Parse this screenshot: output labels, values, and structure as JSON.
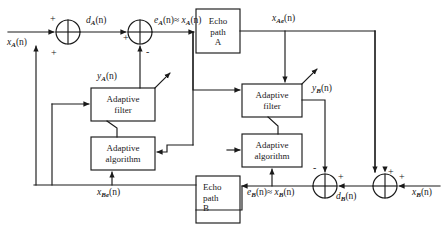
{
  "figure": {
    "type": "block-diagram",
    "domain": "signal-processing"
  },
  "blocks": [
    {
      "id": "echo-path-a",
      "lines": [
        "Echo",
        "path",
        "A"
      ],
      "align": "center"
    },
    {
      "id": "adaptive-filter-a",
      "lines": [
        "Adaptive",
        "filter"
      ],
      "align": "center"
    },
    {
      "id": "adaptive-algorithm-a",
      "lines": [
        "Adaptive",
        "algorithm"
      ],
      "align": "center"
    },
    {
      "id": "echo-path-b",
      "lines": [
        "Echo",
        "path",
        "B"
      ],
      "align": "left"
    },
    {
      "id": "adaptive-filter-b",
      "lines": [
        "Adaptive",
        "filter"
      ],
      "align": "center"
    },
    {
      "id": "adaptive-algorithm-b",
      "lines": [
        "Adaptive",
        "algorithm"
      ],
      "align": "center"
    }
  ],
  "signals": {
    "x_a": {
      "base": "x",
      "sub": "A",
      "arg": "(n)",
      "text": "x_A(n)"
    },
    "d_a": {
      "base": "d",
      "sub": "A",
      "arg": "(n)",
      "text": "d_A(n)"
    },
    "e_a": {
      "base": "e",
      "sub": "A",
      "arg": "(n)",
      "text": "e_A(n)"
    },
    "e_a_approx": {
      "text": "e_A(n) ≈ x_A(n)"
    },
    "y_a": {
      "base": "y",
      "sub": "A",
      "arg": "(n)",
      "text": "y_A(n)"
    },
    "x_ae": {
      "base": "x",
      "sub": "Ae",
      "arg": "(n)",
      "text": "x_Ae(n)"
    },
    "x_be": {
      "base": "x",
      "sub": "Be",
      "arg": "(n)",
      "text": "x_Be(n)"
    },
    "x_b": {
      "base": "x",
      "sub": "B",
      "arg": "(n)",
      "text": "x_B(n)"
    },
    "d_b": {
      "base": "d",
      "sub": "B",
      "arg": "(n)",
      "text": "d_B(n)"
    },
    "e_b_approx": {
      "text": "e_B(n) ≈ x_B(n)"
    },
    "y_b": {
      "base": "y",
      "sub": "B",
      "arg": "(n)",
      "text": "y_B(n)"
    }
  },
  "summers": [
    {
      "id": "summer-a1",
      "signs": {
        "left_input": "+",
        "bottom_input": "+"
      },
      "output_label": "d_A(n)"
    },
    {
      "id": "summer-a2",
      "signs": {
        "left_input": "+",
        "bottom_input": "-"
      },
      "output_label": "e_A(n) ≈ x_A(n)"
    },
    {
      "id": "summer-b1",
      "signs": {
        "top_input": "-",
        "right_input": "+"
      },
      "output_label": "e_B(n) ≈ x_B(n)"
    },
    {
      "id": "summer-b2",
      "signs": {
        "top_input": "+",
        "right_input": "+"
      },
      "output_label": "d_B(n)"
    }
  ],
  "colors": {
    "stroke": "#1a1a1a",
    "text": "#1a1a1a",
    "background": "#ffffff"
  }
}
